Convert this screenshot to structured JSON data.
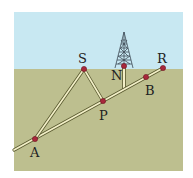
{
  "colors": {
    "sky": "#c8e8f2",
    "ground": "#bdbf8f",
    "rod_fill": "#f3f0c8",
    "rod_edge": "#5a5a30",
    "point": "#a8283c",
    "tower": "#3d4a55"
  },
  "points": [
    {
      "name": "A",
      "label": "A",
      "x": 35,
      "y": 139,
      "lx": 30,
      "ly": 157
    },
    {
      "name": "S",
      "label": "S",
      "x": 84,
      "y": 69,
      "lx": 78,
      "ly": 63
    },
    {
      "name": "P",
      "label": "P",
      "x": 103,
      "y": 101,
      "lx": 105,
      "ly": 119
    },
    {
      "name": "N",
      "label": "N",
      "x": 124,
      "y": 66,
      "lx": 111,
      "ly": 80
    },
    {
      "name": "B",
      "label": "B",
      "x": 146,
      "y": 77,
      "lx": 148,
      "ly": 95
    },
    {
      "name": "R",
      "label": "R",
      "x": 163,
      "y": 68,
      "lx": 158,
      "ly": 63
    }
  ],
  "labels": {
    "A": "A",
    "S": "S",
    "P": "P",
    "N": "N",
    "B": "B",
    "R": "R"
  }
}
